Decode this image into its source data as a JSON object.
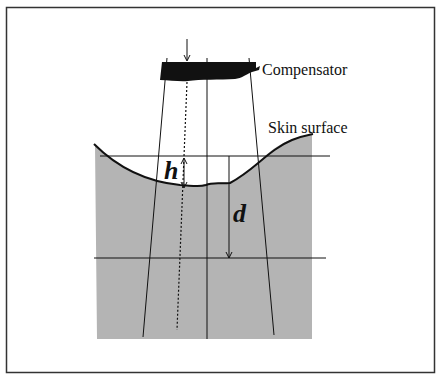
{
  "diagram": {
    "title": "",
    "labels": {
      "compensator": "Compensator",
      "skin_surface": "Skin surface",
      "h": "h",
      "d": "d"
    },
    "colors": {
      "tissue_fill": "#b4b4b4",
      "line": "#111111",
      "compensator_fill": "#111111",
      "background": "#ffffff"
    },
    "elements": [
      "frame",
      "compensator-block",
      "beam-central-axis",
      "beam-edge-left",
      "beam-edge-right",
      "dotted-ray",
      "skin-surface-curve",
      "reference-plane-line",
      "depth-plane-line",
      "h-arrow",
      "d-arrow"
    ]
  }
}
